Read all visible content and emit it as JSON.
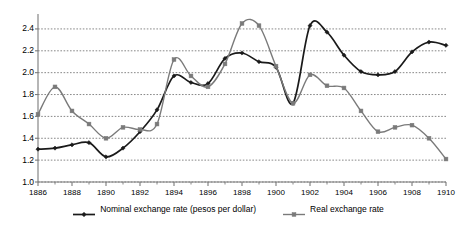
{
  "chart_data": {
    "type": "line",
    "title": "",
    "subtitle": "",
    "xlabel": "",
    "ylabel": "",
    "xlim": [
      1886,
      1910
    ],
    "ylim": [
      1.0,
      2.5
    ],
    "yticks": [
      1.0,
      1.2,
      1.4,
      1.6,
      1.8,
      2.0,
      2.2,
      2.4
    ],
    "ytick_labels": [
      "1.0",
      "1.2",
      "1.4",
      "1.6",
      "1.8",
      "2.0",
      "2.2",
      "2.4"
    ],
    "xticks": [
      1886,
      1888,
      1890,
      1892,
      1894,
      1896,
      1898,
      1900,
      1902,
      1904,
      1906,
      1908,
      1910
    ],
    "xtick_labels": [
      "1886",
      "1888",
      "1890",
      "1892",
      "1894",
      "1896",
      "1898",
      "1900",
      "1902",
      "1904",
      "1906",
      "1908",
      "1910"
    ],
    "x_minor_ticks": [
      1887,
      1889,
      1891,
      1893,
      1895,
      1897,
      1899,
      1901,
      1903,
      1905,
      1907,
      1909
    ],
    "grid": "horizontal-dotted",
    "legend_position": "bottom-center",
    "x": [
      1886,
      1887,
      1888,
      1889,
      1890,
      1891,
      1892,
      1893,
      1894,
      1895,
      1896,
      1897,
      1898,
      1899,
      1900,
      1901,
      1902,
      1903,
      1904,
      1905,
      1906,
      1907,
      1908,
      1909,
      1910
    ],
    "series": [
      {
        "name": "Nominal exchange rate (pesos per dollar)",
        "color": "#1a1a1a",
        "marker": "diamond",
        "values": [
          1.3,
          1.31,
          1.34,
          1.36,
          1.23,
          1.31,
          1.46,
          1.66,
          1.97,
          1.91,
          1.9,
          2.13,
          2.18,
          2.1,
          2.05,
          1.72,
          2.43,
          2.37,
          2.16,
          2.01,
          1.98,
          2.01,
          2.19,
          2.28,
          2.25
        ]
      },
      {
        "name": "Real exchange rate",
        "color": "#7a7a7a",
        "marker": "square",
        "values": [
          1.62,
          1.87,
          1.65,
          1.53,
          1.4,
          1.5,
          1.48,
          1.53,
          2.12,
          1.97,
          1.87,
          2.08,
          2.45,
          2.43,
          2.06,
          1.72,
          1.98,
          1.88,
          1.86,
          1.65,
          1.46,
          1.5,
          1.52,
          1.4,
          1.21
        ]
      }
    ],
    "legend": [
      {
        "label": "Nominal exchange rate (pesos per dollar)",
        "color": "#1a1a1a",
        "marker": "diamond"
      },
      {
        "label": "Real exchange rate",
        "color": "#7a7a7a",
        "marker": "square"
      }
    ]
  },
  "axes": {
    "axis_color": "#7a7a7a",
    "grid_color": "#555555"
  }
}
